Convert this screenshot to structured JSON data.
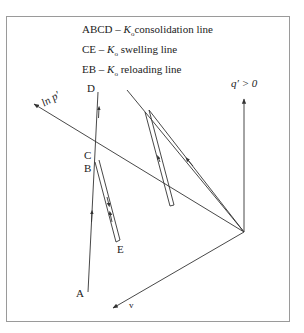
{
  "legend": [
    {
      "prefix": "ABCD – ",
      "symbol": "K",
      "sub": "o",
      "text": "consolidation line"
    },
    {
      "prefix": "CE – ",
      "symbol": "K",
      "sub": "o",
      "text": " swelling line"
    },
    {
      "prefix": "EB – ",
      "symbol": "K",
      "sub": "o",
      "text": " reloading line"
    }
  ],
  "axes": {
    "ln_p": "ln p′",
    "q": "q′ > 0",
    "v": "v"
  },
  "points": {
    "A": "A",
    "B": "B",
    "C": "C",
    "D": "D",
    "E": "E"
  },
  "colors": {
    "line": "#333333",
    "frame": "#9a9a9a"
  }
}
